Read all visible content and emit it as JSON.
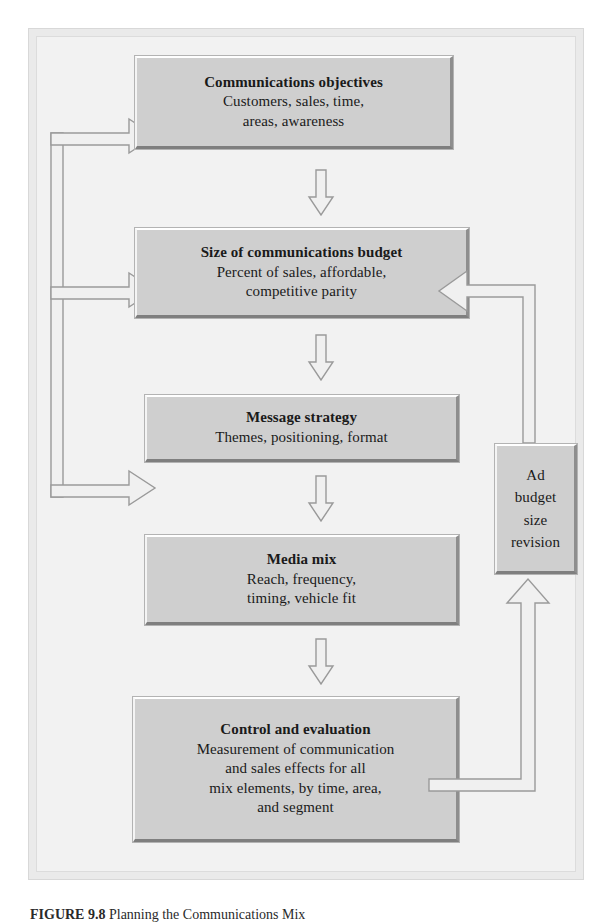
{
  "figure": {
    "caption_label": "FIGURE",
    "caption_number": "9.8",
    "caption_text": "Planning the Communications Mix"
  },
  "diagram": {
    "type": "flowchart",
    "orientation": "vertical",
    "nodes": [
      {
        "id": "objectives",
        "title": "Communications objectives",
        "lines": [
          "Customers, sales, time,",
          "areas, awareness"
        ]
      },
      {
        "id": "budget",
        "title": "Size of communications budget",
        "lines": [
          "Percent of sales, affordable,",
          "competitive parity"
        ]
      },
      {
        "id": "message",
        "title": "Message strategy",
        "lines": [
          "Themes, positioning, format"
        ]
      },
      {
        "id": "media",
        "title": "Media mix",
        "lines": [
          "Reach, frequency,",
          "timing, vehicle fit"
        ]
      },
      {
        "id": "control",
        "title": "Control and evaluation",
        "lines": [
          "Measurement of communication",
          "and sales effects for all",
          "mix elements, by time, area,",
          "and segment"
        ]
      },
      {
        "id": "adbudget",
        "title": "",
        "lines": [
          "Ad",
          "budget",
          "size",
          "revision"
        ]
      }
    ],
    "connectors": [
      {
        "id": "objectives-to-budget",
        "from": "objectives",
        "to": "budget",
        "shape": "down-arrow"
      },
      {
        "id": "budget-to-message",
        "from": "budget",
        "to": "message",
        "shape": "down-arrow"
      },
      {
        "id": "message-to-media",
        "from": "message",
        "to": "media",
        "shape": "down-arrow"
      },
      {
        "id": "media-to-control",
        "from": "media",
        "to": "control",
        "shape": "down-arrow"
      },
      {
        "id": "control-to-adbudget",
        "from": "control",
        "to": "adbudget",
        "shape": "right-then-up-arrow"
      },
      {
        "id": "adbudget-to-budget",
        "from": "adbudget",
        "to": "budget",
        "shape": "up-then-left-arrow"
      },
      {
        "id": "feedback-trunk-to-message",
        "from": "control",
        "to": "message",
        "shape": "left-trunk-right-arrow"
      },
      {
        "id": "feedback-trunk-to-media",
        "from": "control",
        "to": "media",
        "shape": "left-trunk-right-arrow"
      },
      {
        "id": "feedback-trunk-to-control",
        "from": "control",
        "to": "control",
        "shape": "left-trunk-right-arrow"
      }
    ]
  },
  "colors": {
    "box_fill": "#cfcfcf",
    "box_highlight": "#ffffff",
    "box_shadow": "#7f7f7f",
    "arrow_fill": "#f0f0f0",
    "arrow_stroke": "#9a9a9a",
    "frame_bg": "#f2f2f2",
    "page_bg": "#ffffff",
    "text": "#1a1a1a"
  }
}
